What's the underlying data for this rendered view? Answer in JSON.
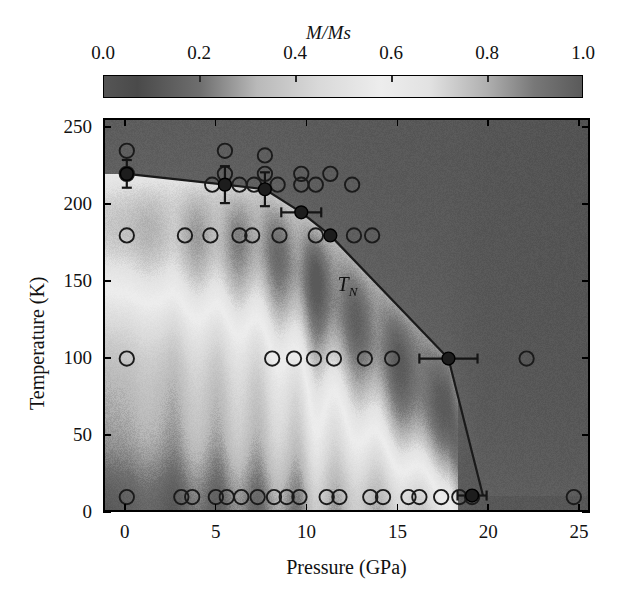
{
  "figure": {
    "colorbar": {
      "title": "M/Ms",
      "ticks": [
        "0.0",
        "0.2",
        "0.4",
        "0.6",
        "0.8",
        "1.0"
      ],
      "tick_values": [
        0.0,
        0.2,
        0.4,
        0.6,
        0.8,
        1.0
      ],
      "range": [
        0.0,
        1.0
      ],
      "colormap": "grayscale-dark-light-dark",
      "stops": [
        {
          "pos": 0.0,
          "color": "#555555"
        },
        {
          "pos": 0.07,
          "color": "#4a4a4a"
        },
        {
          "pos": 0.2,
          "color": "#6e6e6e"
        },
        {
          "pos": 0.32,
          "color": "#b9b9b9"
        },
        {
          "pos": 0.45,
          "color": "#d9d9d9"
        },
        {
          "pos": 0.58,
          "color": "#ededed"
        },
        {
          "pos": 0.68,
          "color": "#e2e2e2"
        },
        {
          "pos": 0.8,
          "color": "#b0b0b0"
        },
        {
          "pos": 0.9,
          "color": "#787878"
        },
        {
          "pos": 1.0,
          "color": "#5a5a5a"
        }
      ]
    },
    "axes": {
      "xlabel": "Pressure (GPa)",
      "ylabel": "Temperature (K)",
      "xticks": [
        "0",
        "5",
        "10",
        "15",
        "20",
        "25"
      ],
      "xtick_values": [
        0,
        5,
        10,
        15,
        20,
        25
      ],
      "yticks": [
        "0",
        "50",
        "100",
        "150",
        "200",
        "250"
      ],
      "ytick_values": [
        0,
        50,
        100,
        150,
        200,
        250
      ],
      "xlim": [
        -1.2,
        25.6
      ],
      "ylim": [
        0,
        256
      ]
    },
    "annotations": [
      {
        "name": "neel-temperature-label",
        "text_main": "T",
        "text_sub": "N",
        "x": 11.6,
        "y": 148
      }
    ]
  },
  "chart_data": {
    "type": "heatmap",
    "title": "",
    "xlabel": "Pressure (GPa)",
    "ylabel": "Temperature (K)",
    "xlim": [
      -1.2,
      25.6
    ],
    "ylim": [
      0,
      256
    ],
    "colorbar_label": "M/Ms",
    "colorbar_range": [
      0.0,
      1.0
    ],
    "grid": false,
    "legend": "none",
    "phase_boundary": {
      "name": "T_N",
      "label": "T_N",
      "x": [
        0.0,
        5.4,
        7.6,
        9.6,
        11.2,
        17.7,
        19.0,
        19.6
      ],
      "y": [
        221,
        214,
        211,
        196,
        181,
        101,
        40,
        12
      ]
    },
    "measured_points": [
      {
        "x": 0.0,
        "y": 221,
        "xerr": 0.0,
        "yerr": 9,
        "filled": true
      },
      {
        "x": 5.4,
        "y": 214,
        "xerr": 0.0,
        "yerr": 12,
        "filled": true
      },
      {
        "x": 7.6,
        "y": 211,
        "xerr": 0.0,
        "yerr": 11,
        "filled": true
      },
      {
        "x": 9.6,
        "y": 196,
        "xerr": 1.1,
        "yerr": 0,
        "filled": true
      },
      {
        "x": 11.2,
        "y": 181,
        "xerr": 0.0,
        "yerr": 0,
        "filled": true
      },
      {
        "x": 17.7,
        "y": 101,
        "xerr": 1.6,
        "yerr": 0,
        "filled": true
      },
      {
        "x": 19.0,
        "y": 12,
        "xerr": 0.8,
        "yerr": 0,
        "filled": true
      }
    ],
    "open_circle_points": [
      {
        "x": 0.0,
        "y": 236
      },
      {
        "x": 5.4,
        "y": 236
      },
      {
        "x": 7.6,
        "y": 233
      },
      {
        "x": 0.0,
        "y": 221
      },
      {
        "x": 5.4,
        "y": 221
      },
      {
        "x": 7.6,
        "y": 221
      },
      {
        "x": 9.6,
        "y": 221
      },
      {
        "x": 11.2,
        "y": 221
      },
      {
        "x": 4.7,
        "y": 214
      },
      {
        "x": 6.2,
        "y": 214
      },
      {
        "x": 7.0,
        "y": 214
      },
      {
        "x": 8.3,
        "y": 214
      },
      {
        "x": 9.6,
        "y": 214
      },
      {
        "x": 10.4,
        "y": 214
      },
      {
        "x": 12.4,
        "y": 214
      },
      {
        "x": 0.0,
        "y": 181
      },
      {
        "x": 3.2,
        "y": 181
      },
      {
        "x": 4.6,
        "y": 181
      },
      {
        "x": 6.2,
        "y": 181
      },
      {
        "x": 6.9,
        "y": 181
      },
      {
        "x": 8.4,
        "y": 181
      },
      {
        "x": 10.4,
        "y": 181
      },
      {
        "x": 12.5,
        "y": 181
      },
      {
        "x": 13.5,
        "y": 181
      },
      {
        "x": 0.0,
        "y": 101
      },
      {
        "x": 8.0,
        "y": 101
      },
      {
        "x": 9.2,
        "y": 101
      },
      {
        "x": 10.3,
        "y": 101
      },
      {
        "x": 11.4,
        "y": 101
      },
      {
        "x": 13.1,
        "y": 101
      },
      {
        "x": 14.6,
        "y": 101
      },
      {
        "x": 22.0,
        "y": 101
      },
      {
        "x": 0.0,
        "y": 11
      },
      {
        "x": 3.0,
        "y": 11
      },
      {
        "x": 3.6,
        "y": 11
      },
      {
        "x": 4.9,
        "y": 11
      },
      {
        "x": 5.5,
        "y": 11
      },
      {
        "x": 6.3,
        "y": 11
      },
      {
        "x": 7.2,
        "y": 11
      },
      {
        "x": 8.1,
        "y": 11
      },
      {
        "x": 8.8,
        "y": 11
      },
      {
        "x": 9.5,
        "y": 11
      },
      {
        "x": 11.0,
        "y": 11
      },
      {
        "x": 11.7,
        "y": 11
      },
      {
        "x": 13.4,
        "y": 11
      },
      {
        "x": 14.1,
        "y": 11
      },
      {
        "x": 15.5,
        "y": 11
      },
      {
        "x": 16.1,
        "y": 11
      },
      {
        "x": 17.3,
        "y": 11
      },
      {
        "x": 18.3,
        "y": 11
      },
      {
        "x": 19.0,
        "y": 11
      },
      {
        "x": 24.6,
        "y": 11
      }
    ],
    "heat_field_description": "Interpolated magnetization map: dark above the T_N boundary (paramagnetic), bright band just below it rising to ~0.6-0.7 M/Ms, with vertical streak artifacts from interpolation between pressure runs; darker again at lowest temperatures and highest pressures.",
    "heat_cells": {
      "x": [
        0,
        2,
        4,
        6,
        8,
        10,
        12,
        14,
        16,
        18,
        20,
        22,
        25
      ],
      "y": [
        0,
        25,
        50,
        75,
        100,
        125,
        150,
        175,
        200,
        225,
        250
      ],
      "values": [
        [
          0.3,
          0.31,
          0.33,
          0.34,
          0.36,
          0.38,
          0.4,
          0.42,
          0.44,
          0.46,
          0.22,
          0.14,
          0.12
        ],
        [
          0.42,
          0.44,
          0.47,
          0.49,
          0.52,
          0.55,
          0.58,
          0.61,
          0.64,
          0.62,
          0.2,
          0.13,
          0.11
        ],
        [
          0.46,
          0.48,
          0.51,
          0.54,
          0.57,
          0.6,
          0.63,
          0.66,
          0.69,
          0.6,
          0.18,
          0.13,
          0.11
        ],
        [
          0.48,
          0.5,
          0.53,
          0.56,
          0.59,
          0.62,
          0.65,
          0.68,
          0.7,
          0.4,
          0.16,
          0.12,
          0.11
        ],
        [
          0.5,
          0.52,
          0.55,
          0.58,
          0.6,
          0.63,
          0.66,
          0.69,
          0.66,
          0.2,
          0.14,
          0.12,
          0.11
        ],
        [
          0.52,
          0.54,
          0.56,
          0.59,
          0.61,
          0.64,
          0.67,
          0.64,
          0.38,
          0.16,
          0.13,
          0.11,
          0.1
        ],
        [
          0.54,
          0.55,
          0.57,
          0.6,
          0.62,
          0.65,
          0.6,
          0.36,
          0.18,
          0.14,
          0.12,
          0.11,
          0.1
        ],
        [
          0.56,
          0.57,
          0.59,
          0.61,
          0.63,
          0.56,
          0.3,
          0.18,
          0.14,
          0.12,
          0.11,
          0.1,
          0.1
        ],
        [
          0.58,
          0.59,
          0.6,
          0.6,
          0.48,
          0.26,
          0.17,
          0.14,
          0.12,
          0.11,
          0.1,
          0.1,
          0.1
        ],
        [
          0.22,
          0.2,
          0.19,
          0.18,
          0.16,
          0.15,
          0.14,
          0.13,
          0.12,
          0.11,
          0.1,
          0.1,
          0.1
        ],
        [
          0.12,
          0.12,
          0.11,
          0.11,
          0.11,
          0.1,
          0.1,
          0.1,
          0.1,
          0.1,
          0.1,
          0.1,
          0.1
        ]
      ]
    }
  }
}
